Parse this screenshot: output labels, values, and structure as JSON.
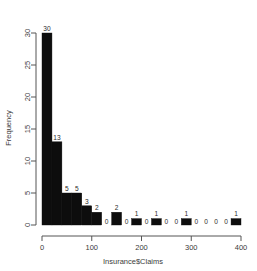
{
  "chart_data": {
    "type": "bar",
    "title": "",
    "xlabel": "Insurance$Claims",
    "ylabel": "Frequency",
    "xlim": [
      0,
      400
    ],
    "ylim": [
      0,
      30
    ],
    "grid": false,
    "legend": "none",
    "bin_width": 20,
    "bar_color": "#0d0d0d",
    "x_ticks": [
      "0",
      "100",
      "200",
      "300",
      "400"
    ],
    "x_tick_values": [
      0,
      100,
      200,
      300,
      400
    ],
    "y_ticks": [
      "0",
      "5",
      "10",
      "15",
      "20",
      "25",
      "30"
    ],
    "y_tick_values": [
      0,
      5,
      10,
      15,
      20,
      25,
      30
    ],
    "categories": [
      "0-20",
      "20-40",
      "40-60",
      "60-80",
      "80-100",
      "100-120",
      "120-140",
      "140-160",
      "160-180",
      "180-200",
      "200-220",
      "220-240",
      "240-260",
      "260-280",
      "280-300",
      "300-320",
      "320-340",
      "340-360",
      "360-380",
      "380-400"
    ],
    "bin_starts": [
      0,
      20,
      40,
      60,
      80,
      100,
      120,
      140,
      160,
      180,
      200,
      220,
      240,
      260,
      280,
      300,
      320,
      340,
      360,
      380
    ],
    "values": [
      30,
      13,
      5,
      5,
      3,
      2,
      0,
      2,
      0,
      1,
      0,
      1,
      0,
      0,
      1,
      0,
      0,
      0,
      0,
      1
    ],
    "bar_labels": [
      "30",
      "13",
      "5",
      "5",
      "3",
      "2",
      "0",
      "2",
      "0",
      "1",
      "0",
      "1",
      "0",
      "0",
      "1",
      "0",
      "0",
      "0",
      "0",
      "1"
    ]
  }
}
